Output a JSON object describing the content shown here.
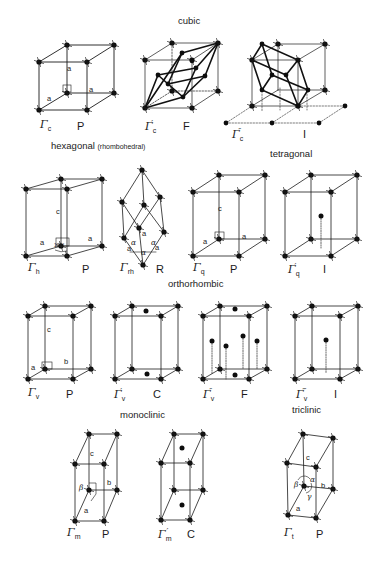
{
  "figure": {
    "sections": [
      {
        "id": "cubic",
        "title": "cubic",
        "x": 178,
        "y": 24
      },
      {
        "id": "hexagonal",
        "title": "hexagonal",
        "subtitle": "(rhombohedral)",
        "x": 51,
        "y": 150
      },
      {
        "id": "tetragonal",
        "title": "tetragonal",
        "x": 270,
        "y": 157
      },
      {
        "id": "orthorhombic",
        "title": "orthorhombic",
        "x": 168,
        "y": 287
      },
      {
        "id": "monoclinic",
        "title": "monoclinic",
        "x": 120,
        "y": 414
      },
      {
        "id": "triclinic",
        "title": "triclinic",
        "x": 292,
        "y": 410
      }
    ],
    "lattices": [
      {
        "id": "cubic-P",
        "symbol": "Γ",
        "subscript": "c",
        "primes": "",
        "type": "P",
        "sym_x": 40,
        "sym_y": 120,
        "type_x": 77,
        "type_y": 120
      },
      {
        "id": "cubic-F",
        "symbol": "Γ",
        "subscript": "c",
        "primes": "′",
        "type": "F",
        "sym_x": 145,
        "sym_y": 120,
        "type_x": 183,
        "type_y": 120
      },
      {
        "id": "cubic-I",
        "symbol": "Γ",
        "subscript": "c",
        "primes": "″",
        "type": "I",
        "sym_x": 232,
        "sym_y": 128,
        "type_x": 303,
        "type_y": 128
      },
      {
        "id": "hexagonal-P",
        "symbol": "Γ",
        "subscript": "h",
        "primes": "",
        "type": "P",
        "sym_x": 28,
        "sym_y": 263,
        "type_x": 82,
        "type_y": 263
      },
      {
        "id": "rhombohedral-R",
        "symbol": "Γ",
        "subscript": "rh",
        "primes": "",
        "type": "R",
        "sym_x": 120,
        "sym_y": 263,
        "type_x": 156,
        "type_y": 263
      },
      {
        "id": "tetragonal-P",
        "symbol": "Γ",
        "subscript": "q",
        "primes": "",
        "type": "P",
        "sym_x": 193,
        "sym_y": 263,
        "type_x": 230,
        "type_y": 263
      },
      {
        "id": "tetragonal-I",
        "symbol": "Γ",
        "subscript": "q",
        "primes": "′",
        "type": "I",
        "sym_x": 288,
        "sym_y": 263,
        "type_x": 323,
        "type_y": 263
      },
      {
        "id": "orthorhombic-P",
        "symbol": "Γ",
        "subscript": "v",
        "primes": "",
        "type": "P",
        "sym_x": 28,
        "sym_y": 388,
        "type_x": 66,
        "type_y": 388
      },
      {
        "id": "orthorhombic-C",
        "symbol": "Γ",
        "subscript": "v",
        "primes": "′",
        "type": "C",
        "sym_x": 114,
        "sym_y": 388,
        "type_x": 153,
        "type_y": 388
      },
      {
        "id": "orthorhombic-F",
        "symbol": "Γ",
        "subscript": "v",
        "primes": "″",
        "type": "F",
        "sym_x": 203,
        "sym_y": 388,
        "type_x": 241,
        "type_y": 388
      },
      {
        "id": "orthorhombic-I",
        "symbol": "Γ",
        "subscript": "v",
        "primes": "‴",
        "type": "I",
        "sym_x": 296,
        "sym_y": 388,
        "type_x": 334,
        "type_y": 388
      },
      {
        "id": "monoclinic-P",
        "symbol": "Γ",
        "subscript": "m",
        "primes": "",
        "type": "P",
        "sym_x": 67,
        "sym_y": 528,
        "type_x": 102,
        "type_y": 528
      },
      {
        "id": "monoclinic-C",
        "symbol": "Γ",
        "subscript": "m",
        "primes": "′",
        "type": "C",
        "sym_x": 158,
        "sym_y": 528,
        "type_x": 187,
        "type_y": 528
      },
      {
        "id": "triclinic-P",
        "symbol": "Γ",
        "subscript": "t",
        "primes": "",
        "type": "P",
        "sym_x": 284,
        "sym_y": 528,
        "type_x": 316,
        "type_y": 528
      }
    ],
    "edge_labels": [
      {
        "text": "a",
        "x": 67,
        "y": 70
      },
      {
        "text": "a",
        "x": 47,
        "y": 100
      },
      {
        "text": "a",
        "x": 89,
        "y": 91
      },
      {
        "text": "c",
        "x": 56,
        "y": 213
      },
      {
        "text": "a",
        "x": 40,
        "y": 244
      },
      {
        "text": "a",
        "x": 88,
        "y": 240
      },
      {
        "text": "120°",
        "x": 54,
        "y": 248,
        "small": true
      },
      {
        "text": "a",
        "x": 142,
        "y": 235
      },
      {
        "text": "a",
        "x": 127,
        "y": 250
      },
      {
        "text": "a",
        "x": 155,
        "y": 249
      },
      {
        "text": "α",
        "x": 131,
        "y": 244,
        "greek": true
      },
      {
        "text": "α",
        "x": 151,
        "y": 244,
        "greek": true
      },
      {
        "text": "α",
        "x": 141,
        "y": 254,
        "greek": true
      },
      {
        "text": "c",
        "x": 218,
        "y": 210
      },
      {
        "text": "a",
        "x": 203,
        "y": 243
      },
      {
        "text": "a",
        "x": 242,
        "y": 238
      },
      {
        "text": "c",
        "x": 47,
        "y": 331
      },
      {
        "text": "a",
        "x": 31,
        "y": 369
      },
      {
        "text": "b",
        "x": 64,
        "y": 363
      },
      {
        "text": "c",
        "x": 90,
        "y": 455
      },
      {
        "text": "β",
        "x": 79,
        "y": 489,
        "greek": true
      },
      {
        "text": "b",
        "x": 107,
        "y": 484
      },
      {
        "text": "a",
        "x": 84,
        "y": 512
      },
      {
        "text": "c",
        "x": 306,
        "y": 459
      },
      {
        "text": "β",
        "x": 294,
        "y": 486,
        "greek": true
      },
      {
        "text": "α",
        "x": 310,
        "y": 481,
        "greek": true
      },
      {
        "text": "b",
        "x": 321,
        "y": 487
      },
      {
        "text": "γ",
        "x": 307,
        "y": 498,
        "greek": true
      },
      {
        "text": "a",
        "x": 296,
        "y": 510
      }
    ],
    "colors": {
      "line": "#1a1a1a",
      "point": "#0d0d0d",
      "dotted": "#444444",
      "background": "#ffffff"
    }
  }
}
